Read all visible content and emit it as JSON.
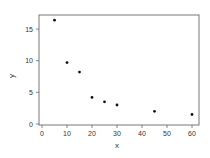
{
  "chart_data": {
    "type": "scatter",
    "title": "",
    "xlabel": "x",
    "ylabel": "y",
    "xlim": [
      -1,
      63
    ],
    "ylim": [
      -0.3,
      17.2
    ],
    "x_ticks": [
      0,
      10,
      20,
      30,
      40,
      50,
      60
    ],
    "y_ticks": [
      0,
      5,
      10,
      15
    ],
    "grid": false,
    "legend": null,
    "series": [
      {
        "name": "data",
        "x": [
          5,
          10,
          15,
          20,
          25,
          30,
          45,
          60
        ],
        "y": [
          16.4,
          9.7,
          8.2,
          4.2,
          3.5,
          3.0,
          2.0,
          1.5
        ],
        "marker": "circle",
        "color": "#111111"
      }
    ]
  },
  "colors": {
    "axis": "#555555",
    "point": "#111111",
    "background": "#ffffff"
  }
}
